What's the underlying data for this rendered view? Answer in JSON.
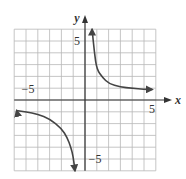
{
  "chart_data": {
    "type": "line",
    "title": "",
    "xlabel": "x",
    "ylabel": "y",
    "xlim": [
      -6,
      6
    ],
    "ylim": [
      -6,
      6
    ],
    "grid": true,
    "grid_step": 1,
    "tick_labels": {
      "x": [
        {
          "value": -5,
          "label": "−5"
        },
        {
          "value": 5,
          "label": "5"
        }
      ],
      "y": [
        {
          "value": 5,
          "label": "5"
        },
        {
          "value": -5,
          "label": "−5"
        }
      ]
    },
    "series": [
      {
        "name": "upper-right branch",
        "x": [
          0.6,
          0.8,
          1.0,
          1.5,
          2.0,
          3.0,
          4.0,
          5.0,
          5.7
        ],
        "y": [
          6.0,
          4.0,
          2.6,
          1.9,
          1.4,
          1.1,
          1.0,
          0.9,
          0.9
        ],
        "arrows": "both"
      },
      {
        "name": "lower-left branch",
        "x": [
          -5.8,
          -5.0,
          -4.0,
          -3.0,
          -2.0,
          -1.5,
          -1.2,
          -1.0,
          -0.85
        ],
        "y": [
          -0.9,
          -1.0,
          -1.2,
          -1.6,
          -2.4,
          -3.2,
          -4.0,
          -4.8,
          -6.0
        ],
        "arrows": "both"
      }
    ],
    "color": "#444444"
  }
}
